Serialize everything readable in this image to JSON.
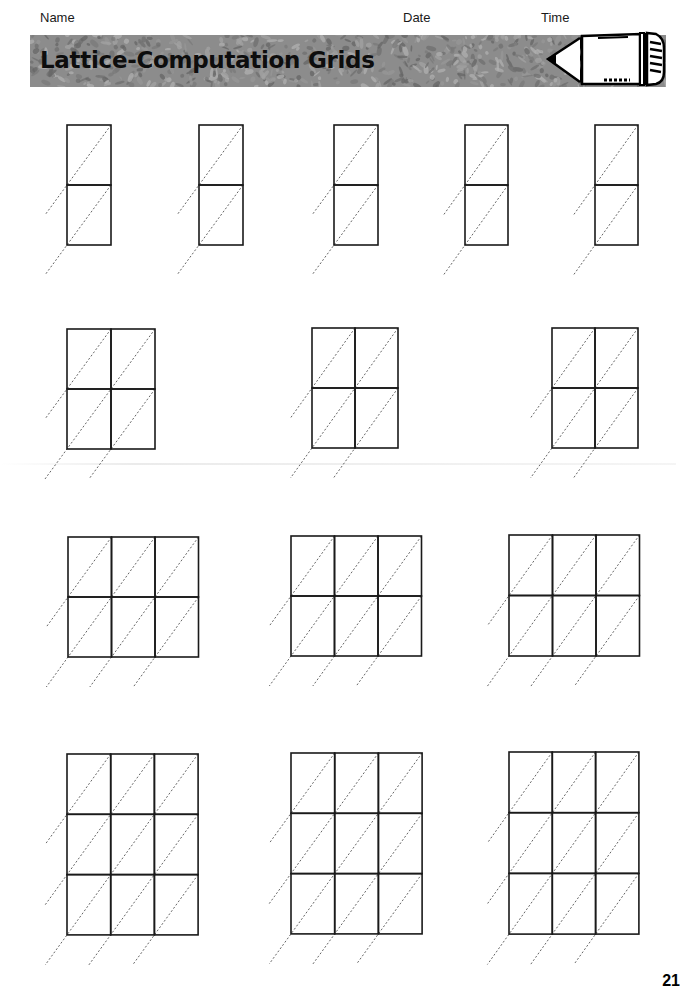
{
  "header": {
    "name_label": "Name",
    "date_label": "Date",
    "time_label": "Time"
  },
  "banner": {
    "title": "Lattice-Computation Grids",
    "icon": "pencil-icon",
    "background_color": "#8c8c8c"
  },
  "grids": [
    {
      "row": 1,
      "x": 67,
      "y": 125,
      "cols": 1,
      "rows": 2,
      "cell_w": 44,
      "cell_h": 60
    },
    {
      "row": 1,
      "x": 199,
      "y": 125,
      "cols": 1,
      "rows": 2,
      "cell_w": 44,
      "cell_h": 60
    },
    {
      "row": 1,
      "x": 334,
      "y": 125,
      "cols": 1,
      "rows": 2,
      "cell_w": 44,
      "cell_h": 60
    },
    {
      "row": 1,
      "x": 465,
      "y": 125,
      "cols": 1,
      "rows": 2,
      "cell_w": 43,
      "cell_h": 60
    },
    {
      "row": 1,
      "x": 595,
      "y": 125,
      "cols": 1,
      "rows": 2,
      "cell_w": 43,
      "cell_h": 60
    },
    {
      "row": 2,
      "x": 67,
      "y": 329,
      "cols": 2,
      "rows": 2,
      "cell_w": 44,
      "cell_h": 60
    },
    {
      "row": 2,
      "x": 312,
      "y": 328,
      "cols": 2,
      "rows": 2,
      "cell_w": 43,
      "cell_h": 60
    },
    {
      "row": 2,
      "x": 552,
      "y": 328,
      "cols": 2,
      "rows": 2,
      "cell_w": 43,
      "cell_h": 60
    },
    {
      "row": 3,
      "x": 68,
      "y": 537,
      "cols": 3,
      "rows": 2,
      "cell_w": 43.5,
      "cell_h": 60
    },
    {
      "row": 3,
      "x": 291,
      "y": 536,
      "cols": 3,
      "rows": 2,
      "cell_w": 43.5,
      "cell_h": 60
    },
    {
      "row": 3,
      "x": 509,
      "y": 535,
      "cols": 3,
      "rows": 2,
      "cell_w": 43.5,
      "cell_h": 60.5
    },
    {
      "row": 4,
      "x": 67,
      "y": 754,
      "cols": 3,
      "rows": 3,
      "cell_w": 43.7,
      "cell_h": 60.3
    },
    {
      "row": 4,
      "x": 291,
      "y": 753,
      "cols": 3,
      "rows": 3,
      "cell_w": 43.7,
      "cell_h": 60.3
    },
    {
      "row": 4,
      "x": 509,
      "y": 752,
      "cols": 3,
      "rows": 3,
      "cell_w": 43.3,
      "cell_h": 60.7
    }
  ],
  "style": {
    "grid_stroke": "#1a1a1a",
    "grid_stroke_width": 1.6,
    "diagonal_stroke": "#555555",
    "diagonal_dash": "2,2"
  },
  "footer": {
    "left_text": "",
    "page_number": "21"
  }
}
